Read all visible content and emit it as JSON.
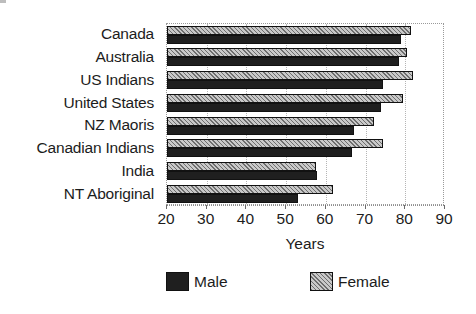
{
  "chart_data": {
    "type": "bar",
    "orientation": "horizontal",
    "title": "",
    "subtitle": "",
    "xlabel": "Years",
    "ylabel": "",
    "xlim": [
      20,
      90
    ],
    "xticks": [
      20,
      30,
      40,
      50,
      60,
      70,
      80,
      90
    ],
    "xtick_labels": [
      "20",
      "30",
      "40",
      "50",
      "60",
      "70",
      "80",
      "90"
    ],
    "grid": true,
    "grid_axis": "x",
    "legend_position": "bottom",
    "categories": [
      "Canada",
      "Australia",
      "US Indians",
      "United States",
      "NZ Maoris",
      "Canadian Indians",
      "India",
      "NT Aboriginal"
    ],
    "series": [
      {
        "name": "Male",
        "color": "#1f1f1f",
        "pattern": "solid",
        "values": [
          79.0,
          78.5,
          74.5,
          74.0,
          67.0,
          66.5,
          57.8,
          53.0
        ]
      },
      {
        "name": "Female",
        "color": "#c9c9c9",
        "pattern": "diagonal-hatch",
        "values": [
          81.5,
          80.5,
          82.0,
          79.5,
          72.0,
          74.5,
          57.5,
          61.8
        ]
      }
    ]
  },
  "legend": {
    "items": [
      {
        "label": "Male",
        "swatch": "male-swatch"
      },
      {
        "label": "Female",
        "swatch": "female-swatch"
      }
    ]
  },
  "axis": {
    "x_title": "Years"
  }
}
